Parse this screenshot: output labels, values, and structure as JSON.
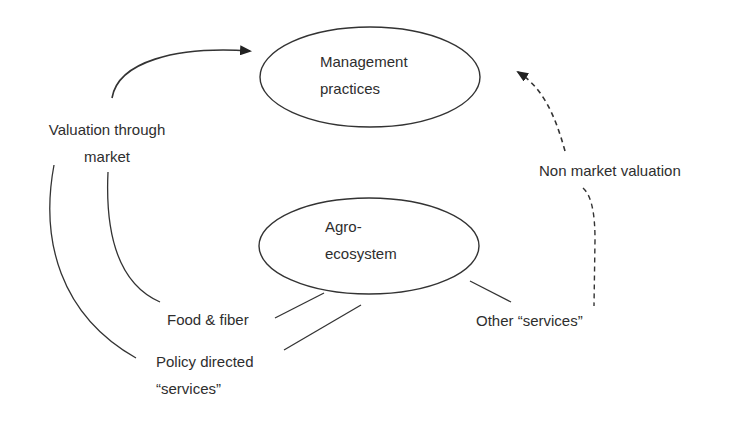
{
  "diagram": {
    "nodes": [
      {
        "id": "management",
        "lines": [
          "Management",
          "practices"
        ],
        "shape": "ellipse"
      },
      {
        "id": "agroecosystem",
        "lines": [
          "Agro-",
          "ecosystem"
        ],
        "shape": "ellipse"
      }
    ],
    "labels": {
      "valuation_market": [
        "Valuation through",
        "market"
      ],
      "non_market": "Non market valuation",
      "food_fiber": "Food & fiber",
      "policy_services": [
        "Policy directed",
        "“services”"
      ],
      "other_services": "Other “services”"
    },
    "edges": [
      {
        "from": "valuation_market",
        "to": "management",
        "style": "solid",
        "arrow": true
      },
      {
        "from": "non_market",
        "to": "management",
        "style": "dashed",
        "arrow": true
      },
      {
        "from": "other_services",
        "to": "non_market",
        "style": "dashed",
        "arrow": false
      },
      {
        "from": "food_fiber",
        "to": "valuation_market",
        "style": "solid",
        "arrow": false
      },
      {
        "from": "policy_services",
        "to": "valuation_market",
        "style": "solid",
        "arrow": false
      },
      {
        "from": "agroecosystem",
        "to": "food_fiber",
        "style": "solid",
        "arrow": false
      },
      {
        "from": "agroecosystem",
        "to": "policy_services",
        "style": "solid",
        "arrow": false
      },
      {
        "from": "agroecosystem",
        "to": "other_services",
        "style": "solid",
        "arrow": false
      }
    ],
    "colors": {
      "stroke": "#333333",
      "text": "#2e2e2e",
      "background": "#ffffff"
    }
  }
}
